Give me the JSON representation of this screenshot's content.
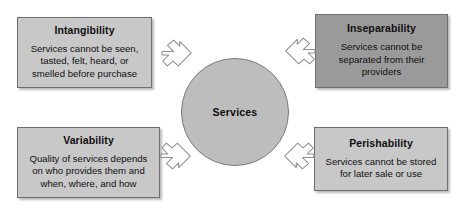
{
  "diagram": {
    "center": {
      "label": "Services",
      "shape": "circle",
      "fill_color": "#bdbdbd"
    },
    "boxes": [
      {
        "id": "intangibility",
        "title": "Intangibility",
        "body": "Services cannot be seen,\ntasted, felt, heard, or\nsmelled before purchase",
        "fill_color": "#c8c8c8",
        "position": "top-left"
      },
      {
        "id": "inseparability",
        "title": "Inseparability",
        "body": "Services cannot be\nseparated from their\nproviders",
        "fill_color": "#9a9a9a",
        "position": "top-right"
      },
      {
        "id": "variability",
        "title": "Variability",
        "body": "Quality of services depends\non who provides them and\nwhen, where, and how",
        "fill_color": "#c8c8c8",
        "position": "bottom-left"
      },
      {
        "id": "perishability",
        "title": "Perishability",
        "body": "Services cannot be stored\nfor later sale or use",
        "fill_color": "#c8c8c8",
        "position": "bottom-right"
      }
    ],
    "arrows": [
      {
        "id": "arrow-top-left",
        "direction": "down-right",
        "points_to": "center"
      },
      {
        "id": "arrow-top-right",
        "direction": "down-left",
        "points_to": "center"
      },
      {
        "id": "arrow-bottom-left",
        "direction": "up-right",
        "points_to": "center"
      },
      {
        "id": "arrow-bottom-right",
        "direction": "up-left",
        "points_to": "center"
      }
    ]
  }
}
